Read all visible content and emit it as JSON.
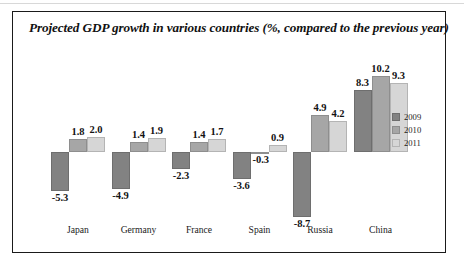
{
  "chart_data": {
    "type": "bar",
    "title": "Projected GDP growth in various countries (%, compared to the previous year)",
    "xlabel": "",
    "ylabel": "",
    "ylim": [
      -9.5,
      11
    ],
    "grid": false,
    "legend_position": "right",
    "categories": [
      "Japan",
      "Germany",
      "France",
      "Spain",
      "Russia",
      "China"
    ],
    "series": [
      {
        "name": "2009",
        "values": [
          -5.3,
          -4.9,
          -2.3,
          -3.6,
          -8.7,
          8.3
        ]
      },
      {
        "name": "2010",
        "values": [
          1.8,
          1.4,
          1.4,
          -0.3,
          4.9,
          10.2
        ]
      },
      {
        "name": "2011",
        "values": [
          2.0,
          1.9,
          1.7,
          0.9,
          4.2,
          9.3
        ]
      }
    ],
    "value_labels": {
      "Japan": [
        "-5.3",
        "1.8",
        "2.0"
      ],
      "Germany": [
        "-4.9",
        "1.4",
        "1.9"
      ],
      "France": [
        "-2.3",
        "1.4",
        "1.7"
      ],
      "Spain": [
        "-3.6",
        "-0.3",
        "0.9"
      ],
      "Russia": [
        "-8.7",
        "4.9",
        "4.2"
      ],
      "China": [
        "8.3",
        "10.2",
        "9.3"
      ]
    },
    "colors": {
      "2009": "#828282",
      "2010": "#a6a6a6",
      "2011": "#d6d6d6"
    }
  },
  "legend": {
    "items": [
      {
        "label": "2009"
      },
      {
        "label": "2010"
      },
      {
        "label": "2011"
      }
    ]
  }
}
